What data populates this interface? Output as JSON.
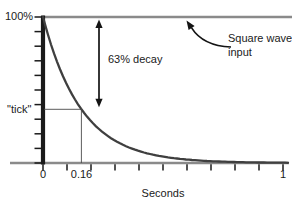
{
  "colors": {
    "axis_line_gray": "#8a8a8a",
    "ink_black": "#1a1a1a",
    "curve_dark_gray": "#3f3f3f"
  },
  "labels": {
    "y_max": "100%",
    "tick_level": "\"tick\"",
    "decay_annotation": "63% decay",
    "square_wave_line1": "Square wave",
    "square_wave_line2": "input",
    "x_origin": "0",
    "x_time_constant": "0.16",
    "x_end": "1",
    "x_axis_title": "Seconds"
  },
  "chart_data": {
    "type": "line",
    "title": "",
    "xlabel": "Seconds",
    "ylabel": "",
    "xlim": [
      0,
      1
    ],
    "ylim_percent": [
      0,
      100
    ],
    "x_tick_interval": 0.1,
    "y_tick_interval_percent": 10,
    "labeled_x_ticks": [
      "0",
      "0.16",
      "1"
    ],
    "series": [
      {
        "name": "Square wave input",
        "shape": "constant",
        "value_percent": 100,
        "x": [
          0,
          1
        ]
      },
      {
        "name": "Exponential decay",
        "shape": "exponential",
        "initial_percent": 100,
        "time_constant_s": 0.16,
        "points_t_percent": [
          [
            0,
            100
          ],
          [
            0.08,
            60.7
          ],
          [
            0.16,
            36.8
          ],
          [
            0.24,
            22.3
          ],
          [
            0.32,
            13.5
          ],
          [
            0.48,
            5.0
          ],
          [
            0.64,
            1.8
          ],
          [
            0.8,
            0.7
          ],
          [
            1.0,
            0.2
          ]
        ]
      }
    ],
    "annotations": [
      {
        "text": "63% decay",
        "kind": "double-headed-arrow",
        "at_t": 0.23,
        "from_percent": 100,
        "to_percent": 37
      },
      {
        "text": "Square wave input",
        "kind": "callout-arrow",
        "target": "100% input line"
      },
      {
        "text": "\"tick\"",
        "kind": "level-marker",
        "level_percent": 37,
        "at_t": 0.16
      }
    ]
  }
}
